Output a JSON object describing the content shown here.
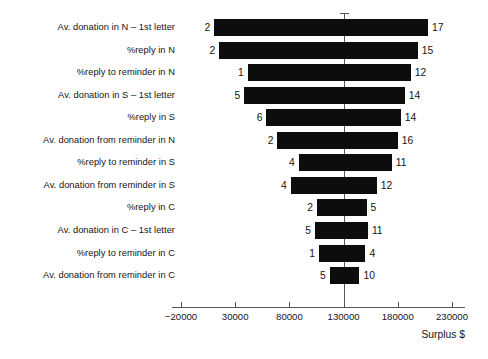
{
  "chart_data": {
    "type": "bar",
    "orientation": "horizontal",
    "variant": "tornado",
    "title": "",
    "xlabel": "Surplus $",
    "ylabel": "",
    "xlim": [
      -20000,
      230000
    ],
    "xticks": [
      -20000,
      30000,
      80000,
      130000,
      180000,
      230000
    ],
    "xtick_labels": [
      "−20000",
      "30000",
      "80000",
      "130000",
      "180000",
      "230000"
    ],
    "grid": false,
    "legend": null,
    "base_value": 130000,
    "bar_color": "#0d0d0d",
    "categories": [
      "Av. donation in N – 1st letter",
      "%reply in N",
      "%reply to reminder in N",
      "Av. donation in S – 1st letter",
      "%reply in S",
      "Av. donation from reminder in N",
      "%reply to reminder in S",
      "Av. donation from reminder in S",
      "%reply in C",
      "Av. donation in C – 1st letter",
      "%reply to reminder in C",
      "Av. donation from reminder in C"
    ],
    "bars": [
      {
        "category": "Av. donation in N – 1st letter",
        "low": 10600,
        "high": 207800,
        "low_label": "2",
        "high_label": "17"
      },
      {
        "category": "%reply in N",
        "low": 15200,
        "high": 198500,
        "low_label": "2",
        "high_label": "15"
      },
      {
        "category": "%reply to reminder in N",
        "low": 41600,
        "high": 192000,
        "low_label": "1",
        "high_label": "12"
      },
      {
        "category": "Av. donation in S – 1st letter",
        "low": 38300,
        "high": 186500,
        "low_label": "5",
        "high_label": "14"
      },
      {
        "category": "%reply in S",
        "low": 58800,
        "high": 182800,
        "low_label": "6",
        "high_label": "14"
      },
      {
        "category": "Av. donation from reminder in N",
        "low": 69000,
        "high": 180000,
        "low_label": "2",
        "high_label": "16"
      },
      {
        "category": "%reply to reminder in S",
        "low": 88600,
        "high": 174400,
        "low_label": "4",
        "high_label": "11"
      },
      {
        "category": "Av. donation from reminder in S",
        "low": 81200,
        "high": 160500,
        "low_label": "4",
        "high_label": "12"
      },
      {
        "category": "%reply in C",
        "low": 105500,
        "high": 151200,
        "low_label": "2",
        "high_label": "5"
      },
      {
        "category": "Av. donation in C – 1st letter",
        "low": 103600,
        "high": 152400,
        "low_label": "5",
        "high_label": "11"
      },
      {
        "category": "%reply to reminder in C",
        "low": 107300,
        "high": 150200,
        "low_label": "1",
        "high_label": "4"
      },
      {
        "category": "Av. donation from reminder in C",
        "low": 117200,
        "high": 144600,
        "low_label": "5",
        "high_label": "10"
      }
    ]
  }
}
